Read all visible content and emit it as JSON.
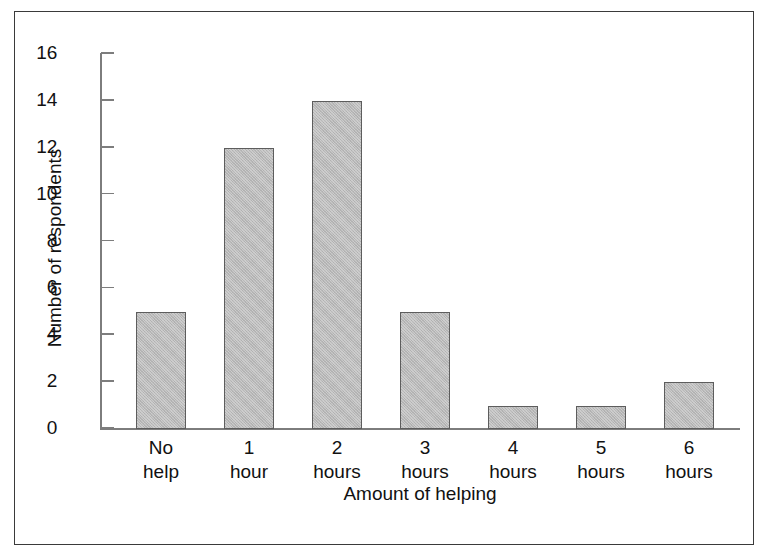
{
  "chart_data": {
    "type": "bar",
    "title": "",
    "xlabel": "Amount of helping",
    "ylabel": "Number of respondents",
    "categories": [
      "No help",
      "1 hour",
      "2 hours",
      "3 hours",
      "4 hours",
      "5 hours",
      "6 hours"
    ],
    "category_lines": [
      [
        "No",
        "help"
      ],
      [
        "1",
        "hour"
      ],
      [
        "2",
        "hours"
      ],
      [
        "3",
        "hours"
      ],
      [
        "4",
        "hours"
      ],
      [
        "5",
        "hours"
      ],
      [
        "6",
        "hours"
      ]
    ],
    "values": [
      5,
      12,
      14,
      5,
      1,
      1,
      2
    ],
    "ylim": [
      0,
      16
    ],
    "ytick_values": [
      0,
      2,
      4,
      6,
      8,
      10,
      12,
      14,
      16
    ],
    "ytick_labels": [
      "0",
      "2",
      "4",
      "6",
      "8",
      "10",
      "12",
      "14",
      "16"
    ],
    "grid": false,
    "legend": null,
    "bar_color": "#b9b9b9",
    "bar_border_color": "#5d5d5d",
    "axis_color": "#7d7d7d",
    "frame_color": "#3a3a3a",
    "text_color": "#111111"
  },
  "yticks": [
    {
      "label": "16",
      "value": 16
    },
    {
      "label": "14",
      "value": 14
    },
    {
      "label": "12",
      "value": 12
    },
    {
      "label": "10",
      "value": 10
    },
    {
      "label": "8",
      "value": 8
    },
    {
      "label": "6",
      "value": 6
    },
    {
      "label": "4",
      "value": 4
    },
    {
      "label": "2",
      "value": 2
    },
    {
      "label": "0",
      "value": 0
    }
  ],
  "bars": [
    {
      "line1": "No",
      "line2": "help",
      "value": 5
    },
    {
      "line1": "1",
      "line2": "hour",
      "value": 12
    },
    {
      "line1": "2",
      "line2": "hours",
      "value": 14
    },
    {
      "line1": "3",
      "line2": "hours",
      "value": 5
    },
    {
      "line1": "4",
      "line2": "hours",
      "value": 1
    },
    {
      "line1": "5",
      "line2": "hours",
      "value": 1
    },
    {
      "line1": "6",
      "line2": "hours",
      "value": 2
    }
  ],
  "axes": {
    "x_title": "Amount of helping",
    "y_title": "Number of respondents"
  }
}
